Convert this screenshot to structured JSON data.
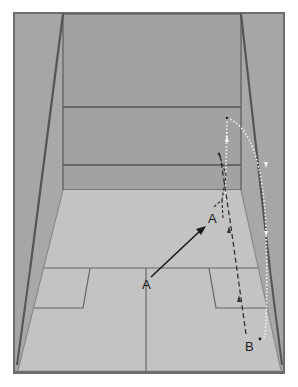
{
  "diagram": {
    "colors": {
      "background": "#ffffff",
      "side_wall": "#a8a8a8",
      "front_wall": "#a3a3a3",
      "floor": "#c2c2c2",
      "lines": "#5a5a5a",
      "frame": "#6e6e6e",
      "player_path": "#1a1a1a",
      "ball_path": "#f2f2f2"
    },
    "labels": {
      "player_start": "A",
      "player_end": "A",
      "opponent": "B"
    },
    "paths": [
      {
        "name": "player-movement",
        "style": "solid-arrow",
        "from": "A (T position)",
        "to": "A (front right)"
      },
      {
        "name": "ball-shot-path",
        "style": "black-dashed",
        "from": "B",
        "to": "front wall"
      },
      {
        "name": "ball-rebound-path",
        "style": "white-dotted",
        "from": "front wall",
        "to": "B (back corner)"
      }
    ]
  }
}
